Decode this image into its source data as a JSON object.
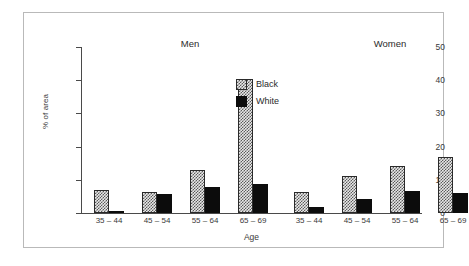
{
  "chart_data": {
    "type": "bar",
    "title": "",
    "xlabel": "Age",
    "ylabel": "% of area",
    "ylim": [
      0,
      50
    ],
    "yticks": [
      0,
      10,
      20,
      30,
      40,
      50
    ],
    "grid": false,
    "legend_position": "center-right",
    "categories": [
      "35 – 44",
      "45 – 54",
      "55 – 64",
      "65 – 69"
    ],
    "panels": [
      {
        "name": "Men",
        "categories": [
          "35 – 44",
          "45 – 54",
          "55 – 64",
          "65 – 69"
        ],
        "series": [
          {
            "name": "Black",
            "values": [
              6.9,
              6.2,
              13.1,
              40.5
            ]
          },
          {
            "name": "White",
            "values": [
              0.5,
              5.8,
              7.8,
              8.7
            ]
          }
        ]
      },
      {
        "name": "Women",
        "categories": [
          "35 – 44",
          "45 – 54",
          "55 – 64",
          "65 – 69"
        ],
        "series": [
          {
            "name": "Black",
            "values": [
              6.4,
              11.2,
              14.2,
              16.8
            ]
          },
          {
            "name": "White",
            "values": [
              1.8,
              4.3,
              6.7,
              6.0
            ]
          }
        ]
      }
    ],
    "legend": [
      {
        "label": "Black",
        "pattern": "hatched",
        "color": "#5c5c5c"
      },
      {
        "label": "White",
        "pattern": "solid",
        "color": "#0c0c0c"
      }
    ]
  },
  "axes": {
    "y_tick_labels": [
      "50",
      "40",
      "30",
      "20",
      "10",
      "0"
    ],
    "y_title": "% of area",
    "x_title": "Age"
  },
  "panel_titles": {
    "left": "Men",
    "right": "Women"
  },
  "legend_entries": {
    "first": "Black",
    "second": "White"
  },
  "colors": {
    "frame": "#b9b9b9",
    "axis": "#4a4a4a",
    "text": "#3a3a3a",
    "hatch": "#5c5c5c",
    "solid": "#0c0c0c",
    "background": "#ffffff"
  }
}
